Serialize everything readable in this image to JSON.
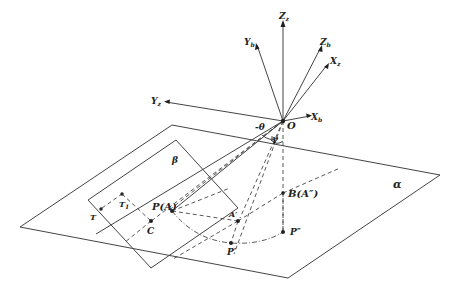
{
  "figure": {
    "type": "3D geometry diagram",
    "planes": [
      {
        "name": "alpha",
        "label": "α"
      },
      {
        "name": "beta",
        "label": "β"
      }
    ],
    "origin_label": "O",
    "axes": [
      {
        "name": "Z_z",
        "label": "Z",
        "sub": "z"
      },
      {
        "name": "Y_b",
        "label": "Y",
        "sub": "b"
      },
      {
        "name": "Z_b",
        "label": "Z",
        "sub": "b"
      },
      {
        "name": "X_z",
        "label": "X",
        "sub": "z"
      },
      {
        "name": "Y_z",
        "label": "Y",
        "sub": "z"
      },
      {
        "name": "X_b",
        "label": "X",
        "sub": "b"
      }
    ],
    "angles": [
      {
        "name": "theta",
        "label": "-θ"
      },
      {
        "name": "gamma",
        "label": "γ"
      }
    ],
    "points": [
      {
        "name": "P_A",
        "label": "P(A)"
      },
      {
        "name": "B_A2",
        "label": "B(A″)"
      },
      {
        "name": "A1",
        "label": "A′"
      },
      {
        "name": "C",
        "label": "C"
      },
      {
        "name": "T",
        "label": "T"
      },
      {
        "name": "T1",
        "label": "T",
        "sub": "1"
      },
      {
        "name": "P1",
        "label": "P′"
      },
      {
        "name": "P2",
        "label": "P″"
      }
    ]
  }
}
